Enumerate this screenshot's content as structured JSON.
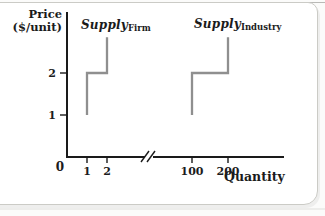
{
  "chart_data": {
    "type": "line",
    "title": "",
    "xlabel": "Quantity",
    "ylabel": "Price ($/unit)",
    "ylabel_lines": [
      "Price",
      "($/unit)"
    ],
    "origin_label": "0",
    "x_ticks": [
      1,
      2,
      100,
      200
    ],
    "y_ticks": [
      1,
      2
    ],
    "axis_break": true,
    "axis_break_between": [
      2,
      100
    ],
    "ylim": [
      0,
      3
    ],
    "grid": false,
    "axis_color": "#1a1a1a",
    "text_color": "#1c1c1c",
    "curve_color": "#8f8f8f",
    "series": [
      {
        "name": "Supply",
        "subscript": "Firm",
        "color": "#8f8f8f",
        "points": [
          [
            1,
            1
          ],
          [
            1,
            2
          ],
          [
            2,
            2
          ],
          [
            2,
            2.85
          ]
        ]
      },
      {
        "name": "Supply",
        "subscript": "Industry",
        "color": "#8f8f8f",
        "points": [
          [
            100,
            1
          ],
          [
            100,
            2
          ],
          [
            200,
            2
          ],
          [
            200,
            2.85
          ]
        ]
      }
    ]
  }
}
